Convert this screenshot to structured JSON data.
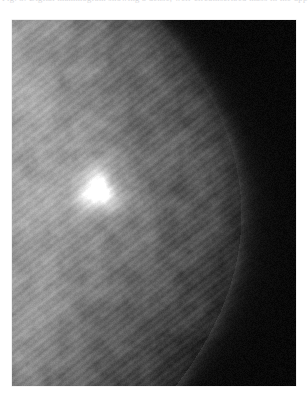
{
  "page": {
    "background_color": "#ffffff",
    "width": 308,
    "height": 406
  },
  "caption": {
    "text": "Fig. 3. Digital mammogram showing a dense, well-circumscribed mass in the upper-inner quadrant of the right breast.",
    "state": "cropped-top-edge",
    "color": "#b9b9c0"
  },
  "figure": {
    "label": "mammogram-scan",
    "modality": "mammography",
    "colorspace": "grayscale",
    "frame": {
      "x": 12,
      "y": 20,
      "width": 284,
      "height": 366
    },
    "background_color": "#000000",
    "tissue_color_light": "#a8a8a8",
    "tissue_color_mid": "#7c7c7c",
    "tissue_color_dark": "#1a1a1a",
    "lesion": {
      "name": "bright-mass",
      "center_x": 86,
      "center_y": 170,
      "radius": 22,
      "peak_color": "#f2f2f2"
    },
    "tissue_edge": {
      "name": "breast-border",
      "description": "convex border running from upper-left to lower-left, bulging right near mid-height",
      "apex_x": 228,
      "apex_y": 215
    },
    "texture": {
      "striation_angle_deg": -52,
      "grain_strength": 0.26
    }
  },
  "chart_data": {
    "type": "heatmap",
    "title": "",
    "xlabel": "",
    "ylabel": "",
    "intensity_range": [
      0,
      255
    ],
    "regions": [
      {
        "name": "upper-left-tissue",
        "x": 0.1,
        "y": 0.1,
        "intensity": 150
      },
      {
        "name": "lesion-core",
        "x": 0.3,
        "y": 0.46,
        "intensity": 242
      },
      {
        "name": "lesion-halo",
        "x": 0.3,
        "y": 0.46,
        "intensity": 175
      },
      {
        "name": "central-tissue",
        "x": 0.4,
        "y": 0.62,
        "intensity": 118
      },
      {
        "name": "lower-left-tissue",
        "x": 0.18,
        "y": 0.88,
        "intensity": 104
      },
      {
        "name": "border-falloff",
        "x": 0.72,
        "y": 0.5,
        "intensity": 52
      },
      {
        "name": "air-background",
        "x": 0.92,
        "y": 0.25,
        "intensity": 10
      },
      {
        "name": "lower-right-air",
        "x": 0.85,
        "y": 0.92,
        "intensity": 8
      }
    ]
  }
}
